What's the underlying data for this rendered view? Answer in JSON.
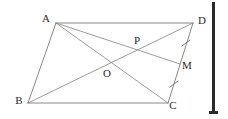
{
  "figure": {
    "shape_type": "parallelogram",
    "stroke_color": "#7a7a7a",
    "label_color": "#2b2b2b",
    "background_color": "#ffffff",
    "gutter_color": "#2a2a2a"
  },
  "points": {
    "A": {
      "label": "A",
      "x": 56,
      "y": 23,
      "label_x": 46,
      "label_y": 19
    },
    "B": {
      "label": "B",
      "x": 28,
      "y": 103,
      "label_x": 19,
      "label_y": 101
    },
    "C": {
      "label": "C",
      "x": 168,
      "y": 103,
      "label_x": 173,
      "label_y": 106
    },
    "D": {
      "label": "D",
      "x": 193,
      "y": 23,
      "label_x": 200,
      "label_y": 21
    },
    "O": {
      "label": "O",
      "x": 110,
      "y": 65,
      "label_x": 107,
      "label_y": 74
    },
    "P": {
      "label": "P",
      "x": 140,
      "y": 48,
      "label_x": 137,
      "label_y": 41
    },
    "M": {
      "label": "M",
      "x": 180,
      "y": 64,
      "label_x": 185,
      "label_y": 66
    }
  },
  "segments": [
    {
      "name": "side-AD",
      "from": "A",
      "to": "D",
      "kind": "edge"
    },
    {
      "name": "side-AB",
      "from": "A",
      "to": "B",
      "kind": "edge"
    },
    {
      "name": "side-BC",
      "from": "B",
      "to": "C",
      "kind": "edge"
    },
    {
      "name": "side-DC",
      "from": "D",
      "to": "C",
      "kind": "edge"
    },
    {
      "name": "diagonal-AC",
      "from": "A",
      "to": "C",
      "kind": "diagonal"
    },
    {
      "name": "diagonal-BD",
      "from": "B",
      "to": "D",
      "kind": "diagonal"
    },
    {
      "name": "cevian-AM",
      "from": "A",
      "to": "M",
      "kind": "cevian"
    }
  ],
  "tick_marks": [
    {
      "name": "tick-DM",
      "on_segment": "DM",
      "x": 186,
      "y": 43,
      "angle": 28,
      "count": 1
    },
    {
      "name": "tick-MC",
      "on_segment": "MC",
      "x": 174,
      "y": 84,
      "angle": 28,
      "count": 1
    }
  ],
  "gutter": {
    "name": "right-margin-bar",
    "x": 212,
    "y": 2,
    "width": 3,
    "height": 112,
    "foot_width": 9,
    "foot_height": 3
  }
}
